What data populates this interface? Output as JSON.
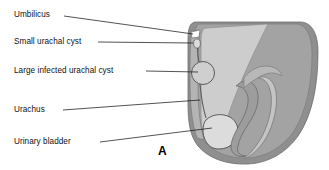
{
  "figure": {
    "panel_letter": "A",
    "labels": [
      {
        "id": "umbilicus",
        "text": "Umbilicus",
        "x": 14,
        "y": 14
      },
      {
        "id": "small-urachal-cyst",
        "text": "Small urachal cyst",
        "x": 14,
        "y": 39
      },
      {
        "id": "large-infected-cyst",
        "text": "Large infected urachal cyst",
        "x": 14,
        "y": 68
      },
      {
        "id": "urachus",
        "text": "Urachus",
        "x": 14,
        "y": 107
      },
      {
        "id": "urinary-bladder",
        "text": "Urinary bladder",
        "x": 14,
        "y": 139
      }
    ],
    "colors": {
      "background": "#ffffff",
      "text": "#111111",
      "leader_line": "#1a1a1a",
      "tissue_light": "#cccccc",
      "tissue_medium": "#9a9a9a",
      "tissue_dark": "#8a8a8a",
      "outline": "#666666",
      "cyst_fill": "#d8d8d8"
    },
    "structures": [
      {
        "name": "abdominal-wall"
      },
      {
        "name": "umbilicus-notch"
      },
      {
        "name": "small-urachal-cyst-shape"
      },
      {
        "name": "large-infected-urachal-cyst-shape"
      },
      {
        "name": "urachus-tract"
      },
      {
        "name": "urinary-bladder-shape"
      },
      {
        "name": "pelvic-viscera"
      },
      {
        "name": "body-contour"
      }
    ]
  }
}
